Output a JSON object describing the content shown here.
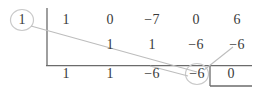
{
  "figure": {
    "type": "synthetic-division-tableau",
    "divisor": "1",
    "rows": {
      "dividend_label": "dividend-coefficients",
      "dividend": [
        "1",
        "0",
        "−7",
        "0",
        "6"
      ],
      "carry_label": "carry-products",
      "carry": [
        "1",
        "1",
        "−6",
        "−6"
      ],
      "result_label": "quotient-coefficients",
      "result": [
        "1",
        "1",
        "−6",
        "−6"
      ],
      "remainder": "0"
    },
    "annotations": {
      "circled_divisor": "1",
      "circled_result": "−6",
      "boxed_remainder": "0"
    },
    "colors": {
      "ink": "#3a3a3a",
      "rule": "#6b6b6b",
      "light_rule": "#b9b9b9",
      "circle": "#c9c9c9",
      "background": "#ffffff"
    }
  }
}
